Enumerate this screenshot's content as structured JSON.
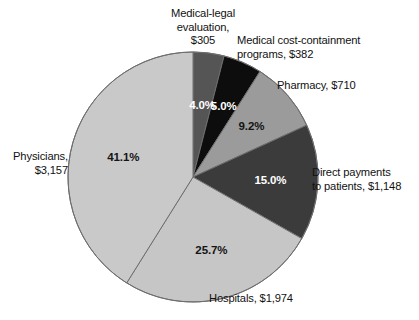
{
  "figure": {
    "title": "",
    "background_color": "#ffffff"
  },
  "chart_data": {
    "type": "pie",
    "title": "",
    "xlabel": "",
    "ylabel": "",
    "units": "millions of dollars",
    "total_value": 7676,
    "start_angle_deg": 0,
    "direction": "clockwise",
    "legend": "none (direct callout labels)",
    "grid": false,
    "categories": [
      "Medical-legal evaluation",
      "Medical cost-containment programs",
      "Pharmacy",
      "Direct payments to patients",
      "Hospitals",
      "Physicians"
    ],
    "values": [
      305,
      382,
      710,
      1148,
      1974,
      3157
    ],
    "percentages": [
      4.0,
      5.0,
      9.2,
      15.0,
      25.7,
      41.1
    ],
    "colors": [
      "#555555",
      "#0d0d0d",
      "#9b9b9b",
      "#3b3b3b",
      "#c6c6c6",
      "#c9c9c9"
    ],
    "slices": [
      {
        "name": "Medical-legal evaluation",
        "callout": "Medical-legal\nevaluation,\n$305",
        "value_label": "$305",
        "percent_label": "4.0%",
        "percent": 4.0,
        "value": 305,
        "color": "#555555",
        "percent_text_color": "#ffffff"
      },
      {
        "name": "Medical cost-containment programs",
        "callout": "Medical cost-containment\nprograms, $382",
        "value_label": "$382",
        "percent_label": "5.0%",
        "percent": 5.0,
        "value": 382,
        "color": "#0d0d0d",
        "percent_text_color": "#ffffff"
      },
      {
        "name": "Pharmacy",
        "callout": "Pharmacy, $710",
        "value_label": "$710",
        "percent_label": "9.2%",
        "percent": 9.2,
        "value": 710,
        "color": "#9b9b9b",
        "percent_text_color": "#141414"
      },
      {
        "name": "Direct payments to patients",
        "callout": "Direct payments\nto patients, $1,148",
        "value_label": "$1,148",
        "percent_label": "15.0%",
        "percent": 15.0,
        "value": 1148,
        "color": "#3b3b3b",
        "percent_text_color": "#ffffff"
      },
      {
        "name": "Hospitals",
        "callout": "Hospitals, $1,974",
        "value_label": "$1,974",
        "percent_label": "25.7%",
        "percent": 25.7,
        "value": 1974,
        "color": "#c6c6c6",
        "percent_text_color": "#141414"
      },
      {
        "name": "Physicians",
        "callout": "Physicians,\n$3,157",
        "value_label": "$3,157",
        "percent_label": "41.1%",
        "percent": 41.1,
        "value": 3157,
        "color": "#c9c9c9",
        "percent_text_color": "#141414"
      }
    ],
    "geometry": {
      "center_x": 193,
      "center_y": 177,
      "radius": 125,
      "outline_color": "#6e6e6e"
    }
  }
}
